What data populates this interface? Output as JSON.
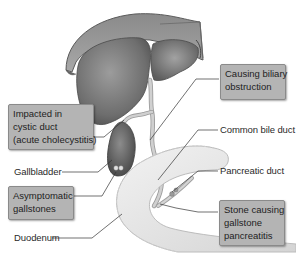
{
  "diagram": {
    "colors": {
      "organ_fill": "#7a7a7a",
      "organ_dark": "#555555",
      "duodenum_fill": "#e6e6e6",
      "duct_fill": "#cfcfcf",
      "callout_box": "#b4b4b4",
      "leader_line": "#333333"
    },
    "structures": [
      "liver",
      "gallbladder",
      "cystic duct",
      "common bile duct",
      "pancreatic duct",
      "duodenum"
    ],
    "callouts": {
      "impacted": [
        "Impacted in",
        "cystic duct",
        "(acute cholecystitis)"
      ],
      "biliary": [
        "Causing biliary",
        "obstruction"
      ],
      "asymptomatic": [
        "Asymptomatic",
        "gallstones"
      ],
      "pancreatitis": [
        "Stone causing",
        "gallstone",
        "pancreatitis"
      ]
    },
    "labels": {
      "gallbladder": "Gallbladder",
      "common_bile_duct": "Common bile duct",
      "pancreatic_duct": "Pancreatic duct",
      "duodenum": "Duodenum"
    }
  }
}
